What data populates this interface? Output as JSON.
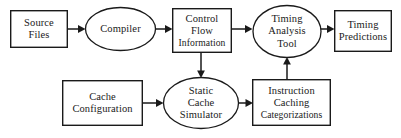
{
  "diagram": {
    "background_color": "#ffffff",
    "stroke_color": "#1a1a1a",
    "nodes": [
      {
        "id": "source-files",
        "shape": "rectangle",
        "lines": [
          "Source",
          "Files"
        ],
        "x": 10,
        "y": 10,
        "w": 58,
        "h": 38
      },
      {
        "id": "compiler",
        "shape": "ellipse",
        "lines": [
          "Compiler"
        ],
        "x": 85,
        "y": 7,
        "w": 71,
        "h": 44
      },
      {
        "id": "control-flow-information",
        "shape": "rectangle",
        "lines": [
          "Control",
          "Flow",
          "Information"
        ],
        "x": 172,
        "y": 8,
        "w": 60,
        "h": 45
      },
      {
        "id": "timing-analysis-tool",
        "shape": "ellipse",
        "lines": [
          "Timing",
          "Analysis",
          "Tool"
        ],
        "x": 252,
        "y": 5,
        "w": 70,
        "h": 53
      },
      {
        "id": "timing-predictions",
        "shape": "rectangle",
        "lines": [
          "Timing",
          "Predictions"
        ],
        "x": 334,
        "y": 10,
        "w": 58,
        "h": 42
      },
      {
        "id": "cache-configuration",
        "shape": "rectangle",
        "lines": [
          "Cache",
          "Configuration"
        ],
        "x": 62,
        "y": 80,
        "w": 81,
        "h": 46
      },
      {
        "id": "static-cache-simulator",
        "shape": "ellipse",
        "lines": [
          "Static",
          "Cache",
          "Simulator"
        ],
        "x": 163,
        "y": 77,
        "w": 76,
        "h": 52
      },
      {
        "id": "instruction-caching-categorizations",
        "shape": "rectangle",
        "lines": [
          "Instruction",
          "Caching",
          "Categorizations"
        ],
        "x": 252,
        "y": 79,
        "w": 79,
        "h": 47
      }
    ],
    "edges": [
      {
        "id": "source-files-to-compiler",
        "from": "source-files",
        "to": "compiler",
        "direction": "right"
      },
      {
        "id": "compiler-to-control-flow-information",
        "from": "compiler",
        "to": "control-flow-information",
        "direction": "right"
      },
      {
        "id": "control-flow-information-to-timing-analysis-tool",
        "from": "control-flow-information",
        "to": "timing-analysis-tool",
        "direction": "right"
      },
      {
        "id": "timing-analysis-tool-to-timing-predictions",
        "from": "timing-analysis-tool",
        "to": "timing-predictions",
        "direction": "right"
      },
      {
        "id": "control-flow-information-to-static-cache-simulator",
        "from": "control-flow-information",
        "to": "static-cache-simulator",
        "direction": "down"
      },
      {
        "id": "cache-configuration-to-static-cache-simulator",
        "from": "cache-configuration",
        "to": "static-cache-simulator",
        "direction": "right"
      },
      {
        "id": "static-cache-simulator-to-instruction-caching-categorizations",
        "from": "static-cache-simulator",
        "to": "instruction-caching-categorizations",
        "direction": "right"
      },
      {
        "id": "instruction-caching-categorizations-to-timing-analysis-tool",
        "from": "instruction-caching-categorizations",
        "to": "timing-analysis-tool",
        "direction": "up"
      }
    ]
  }
}
